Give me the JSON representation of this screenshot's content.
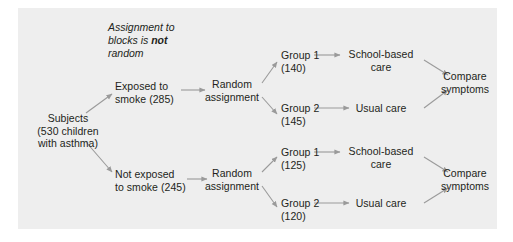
{
  "diagram": {
    "background_color": "#eeeeee",
    "page_color": "#ffffff",
    "text_color": "#231f20",
    "arrow_color": "#8c8c8c",
    "annotation": {
      "line1": "Assignment to",
      "line2_prefix": "blocks is ",
      "line2_bold": "not",
      "line3": "random"
    },
    "nodes": {
      "subjects": "Subjects\n(530 children\nwith asthma)",
      "block_exposed": "Exposed to\nsmoke (285)",
      "block_not_exposed": "Not exposed\nto smoke (245)",
      "random_assignment_top": "Random\nassignment",
      "random_assignment_bottom": "Random\nassignment",
      "group1_top": "Group 1\n(140)",
      "group2_top": "Group 2\n(145)",
      "group1_bottom": "Group 1\n(125)",
      "group2_bottom": "Group 2\n(120)",
      "treatment_school_top": "School-based\ncare",
      "treatment_usual_top": "Usual care",
      "treatment_school_bottom": "School-based\ncare",
      "treatment_usual_bottom": "Usual care",
      "compare_top": "Compare\nsymptoms",
      "compare_bottom": "Compare\nsymptoms"
    }
  }
}
